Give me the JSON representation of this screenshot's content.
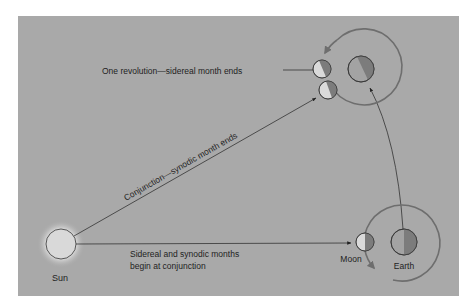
{
  "figure": {
    "background_color": "#a9a9a9",
    "page_color": "#ffffff",
    "line_color": "#222222",
    "orbit_color": "#6e6e6e",
    "body_light_color": "#d6d6d6",
    "body_dark_color": "#7c7c7c",
    "sun_color": "#d9d9d9"
  },
  "labels": {
    "sun": "Sun",
    "moon": "Moon",
    "earth": "Earth",
    "start_line1": "Sidereal and synodic months",
    "start_line2": "begin at conjunction",
    "synodic": "Conjunction—synodic month ends",
    "sidereal": "One revolution—sidereal month ends"
  }
}
